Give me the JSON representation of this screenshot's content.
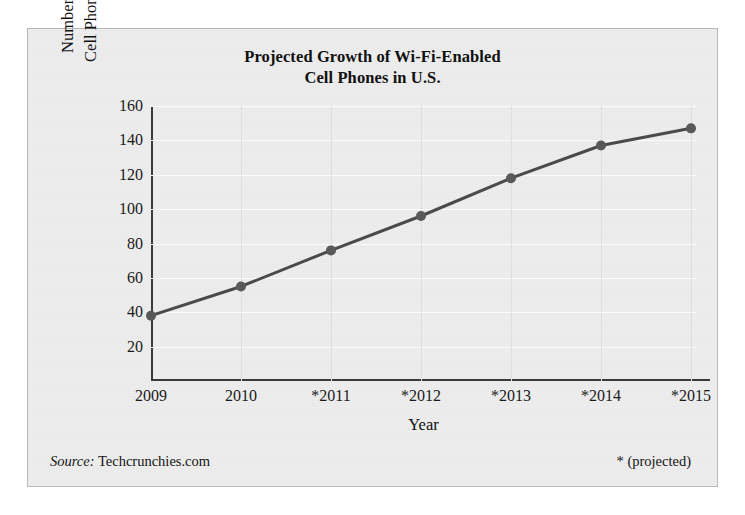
{
  "figure": {
    "background": "#ebebeb",
    "border_color": "#b9b9b9"
  },
  "source": {
    "label": "Source:",
    "value": "Techcrunchies.com"
  },
  "footnote": "* (projected)",
  "chart_data": {
    "type": "line",
    "title": "Projected Growth of Wi-Fi-Enabled Cell Phones in U.S.",
    "title_line1": "Projected Growth of Wi-Fi-Enabled",
    "title_line2": "Cell Phones in U.S.",
    "xlabel": "Year",
    "ylabel": "Number of W-iFi-Enabled Cell Phones in U.S. (in millions)",
    "ylabel_line1": "Number of W-iFi-Enabled",
    "ylabel_line2": "Cell Phones in U.S. (in millions)",
    "categories": [
      "2009",
      "2010",
      "*2011",
      "*2012",
      "*2013",
      "*2014",
      "*2015"
    ],
    "x": [
      2009,
      2010,
      2011,
      2012,
      2013,
      2014,
      2015
    ],
    "values": [
      38,
      55,
      76,
      96,
      118,
      137,
      147
    ],
    "ylim": [
      0,
      160
    ],
    "yticks": [
      20,
      40,
      60,
      80,
      100,
      120,
      140,
      160
    ],
    "ytick_labels": [
      "20",
      "40",
      "60",
      "80",
      "100",
      "120",
      "140",
      "160"
    ],
    "grid": true,
    "grid_color": "#fbfbfb",
    "vertical_grid_color": "#dedede",
    "legend": false,
    "line_color": "#4a4a4a",
    "marker_color": "#595959",
    "marker": "circle",
    "axis_color": "#3a3a3a"
  }
}
